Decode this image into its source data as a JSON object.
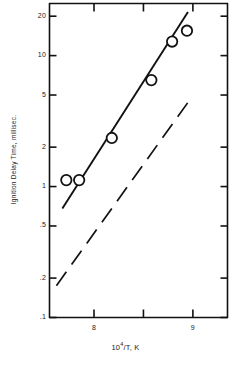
{
  "chart_data": {
    "type": "scatter",
    "title": "",
    "subtitle": "",
    "xlabel": "10^4/T, K",
    "xlabel_base": "10",
    "xlabel_exponent": "4",
    "xlabel_rest": "/T, K",
    "ylabel": "Ignition Delay Time, millisec.",
    "xscale": "linear",
    "yscale": "log",
    "xlim": [
      7.55,
      9.35
    ],
    "ylim": [
      0.1,
      25.0
    ],
    "grid": false,
    "legend": "none",
    "x_ticks": [
      {
        "value": 8,
        "label": "8"
      },
      {
        "value": 8.5,
        "label": ""
      },
      {
        "value": 9,
        "label": "9"
      }
    ],
    "y_ticks": [
      {
        "value": 20,
        "label": "20"
      },
      {
        "value": 10,
        "label": "10"
      },
      {
        "value": 5,
        "label": "5"
      },
      {
        "value": 2,
        "label": "2"
      },
      {
        "value": 1,
        "label": "1"
      },
      {
        "value": 0.5,
        "label": ".5"
      },
      {
        "value": 0.2,
        "label": ".2"
      },
      {
        "value": 0.1,
        "label": ".1"
      }
    ],
    "series": [
      {
        "name": "Ignition delay data",
        "type": "scatter",
        "marker": "open-circle",
        "points": [
          {
            "x": 7.72,
            "y": 1.12
          },
          {
            "x": 7.85,
            "y": 1.12
          },
          {
            "x": 8.18,
            "y": 2.35
          },
          {
            "x": 8.58,
            "y": 6.5
          },
          {
            "x": 8.79,
            "y": 12.8
          },
          {
            "x": 8.94,
            "y": 15.5
          }
        ]
      },
      {
        "name": "Correlation fit line",
        "type": "line",
        "style": "solid",
        "endpoints": [
          {
            "x": 7.68,
            "y": 0.68
          },
          {
            "x": 8.95,
            "y": 21.5
          }
        ]
      },
      {
        "name": "Reference line",
        "type": "line",
        "style": "dashed",
        "endpoints": [
          {
            "x": 7.62,
            "y": 0.175
          },
          {
            "x": 8.96,
            "y": 4.5
          }
        ]
      }
    ]
  }
}
